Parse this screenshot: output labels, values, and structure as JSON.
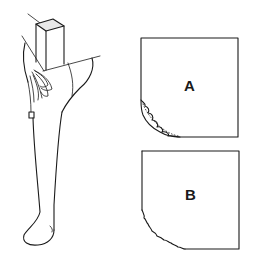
{
  "figure": {
    "colors": {
      "ink": "#1a1a1a",
      "background": "#ffffff",
      "block_top_shading": "#e8e8e8"
    }
  },
  "templates": [
    {
      "id": "A",
      "label": "A",
      "corner_profile": "scalloped with dotted guide line"
    },
    {
      "id": "B",
      "label": "B",
      "corner_profile": "rough irregular curve"
    }
  ]
}
